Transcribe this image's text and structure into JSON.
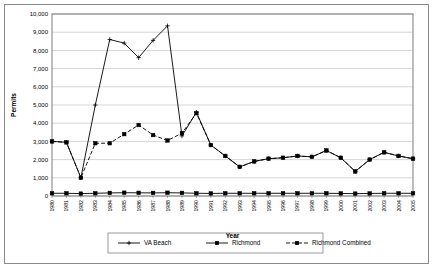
{
  "chart_data": {
    "type": "line",
    "title": "",
    "xlabel": "Year",
    "ylabel": "Permits",
    "ylim": [
      0,
      10000
    ],
    "ytick_step": 1000,
    "ytick_labels": [
      "0",
      "1,000",
      "2,000",
      "3,000",
      "4,000",
      "5,000",
      "6,000",
      "7,000",
      "8,000",
      "9,000",
      "10,000"
    ],
    "grid": true,
    "legend_position": "bottom",
    "categories": [
      "1980",
      "1981",
      "1982",
      "1983",
      "1984",
      "1985",
      "1986",
      "1987",
      "1988",
      "1989",
      "1990",
      "1991",
      "1992",
      "1993",
      "1994",
      "1995",
      "1996",
      "1997",
      "1998",
      "1999",
      "2000",
      "2001",
      "2002",
      "2003",
      "2004",
      "2005"
    ],
    "series": [
      {
        "name": "VA Beach",
        "marker": "plus",
        "values": [
          3000,
          2950,
          1000,
          5000,
          8600,
          8400,
          7600,
          8550,
          9350,
          3300,
          4600,
          2800,
          2200,
          1600,
          1900,
          2050,
          2100,
          2200,
          2150,
          2500,
          2100,
          1350,
          2000,
          2400,
          2200,
          2050
        ]
      },
      {
        "name": "Richmond",
        "marker": "square",
        "values": [
          150,
          150,
          130,
          150,
          170,
          180,
          175,
          170,
          180,
          170,
          150,
          140,
          150,
          150,
          150,
          150,
          150,
          150,
          150,
          150,
          140,
          130,
          140,
          150,
          150,
          150
        ]
      },
      {
        "name": "Richmond Combined",
        "marker": "square-dashed",
        "values": [
          3000,
          2950,
          1000,
          2900,
          2900,
          3400,
          3900,
          3350,
          3050,
          3450,
          4550,
          2800,
          2200,
          1600,
          1900,
          2050,
          2100,
          2200,
          2150,
          2500,
          2100,
          1350,
          2000,
          2400,
          2200,
          2050
        ]
      }
    ]
  },
  "legend": {
    "items": [
      {
        "label": "VA Beach"
      },
      {
        "label": "Richmond"
      },
      {
        "label": "Richmond Combined"
      }
    ]
  }
}
